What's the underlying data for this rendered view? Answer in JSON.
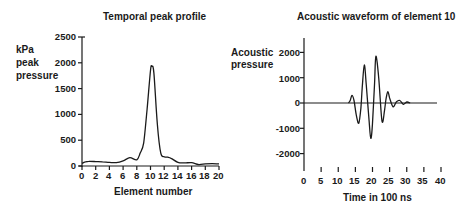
{
  "chart_data": [
    {
      "type": "line",
      "title": "Temporal peak profile",
      "xlabel": "Element number",
      "ylabel": "kPa peak pressure",
      "ylabel_lines": [
        "kPa",
        "peak",
        "pressure"
      ],
      "xlim": [
        0,
        20
      ],
      "ylim": [
        0,
        2500
      ],
      "xticks": [
        0,
        2,
        4,
        6,
        8,
        10,
        12,
        14,
        16,
        18,
        20
      ],
      "yticks": [
        0,
        500,
        1000,
        1500,
        2000,
        2500
      ],
      "grid": false,
      "x": [
        0,
        0.5,
        1,
        2,
        3,
        4,
        5,
        6,
        7,
        8,
        8.5,
        9,
        9.5,
        10,
        10.2,
        10.5,
        11,
        11.5,
        12,
        12.5,
        13,
        14,
        15,
        16,
        17,
        18,
        19,
        20
      ],
      "values": [
        50,
        80,
        90,
        85,
        80,
        70,
        65,
        100,
        160,
        120,
        250,
        450,
        1100,
        1850,
        1930,
        1800,
        800,
        250,
        180,
        170,
        150,
        70,
        60,
        65,
        30,
        40,
        45,
        40
      ]
    },
    {
      "type": "line",
      "title": "Acoustic waveform of element 10",
      "xlabel": "Time in 100 ns",
      "ylabel": "Acoustic pressure",
      "ylabel_lines": [
        "Acoustic",
        "pressure"
      ],
      "xlim": [
        0,
        40
      ],
      "ylim": [
        -2500,
        2500
      ],
      "xticks": [
        0,
        5,
        10,
        15,
        20,
        25,
        30,
        35,
        40
      ],
      "yticks": [
        2000,
        1000,
        0,
        -1000,
        -2000
      ],
      "grid": false,
      "x": [
        0,
        13,
        13.5,
        14,
        14.6,
        15.3,
        16,
        16.6,
        17,
        17.6,
        18.2,
        19,
        19.5,
        20,
        20.6,
        21,
        21.8,
        22.6,
        23,
        23.5,
        24,
        24.5,
        25,
        26,
        27,
        28,
        29,
        30,
        31,
        40
      ],
      "values": [
        0,
        0,
        100,
        300,
        100,
        -500,
        -800,
        -200,
        600,
        1500,
        700,
        -700,
        -1400,
        -800,
        800,
        1850,
        1000,
        -500,
        -750,
        -300,
        200,
        450,
        200,
        -150,
        50,
        100,
        -50,
        40,
        0,
        0
      ]
    }
  ],
  "left_chart": {
    "title": "Temporal peak profile",
    "ylabel": [
      "kPa",
      "peak",
      "pressure"
    ],
    "xlabel": "Element number",
    "yticks": [
      "2500",
      "2000",
      "1500",
      "1000",
      "500",
      "0"
    ],
    "xticks": [
      "0",
      "2",
      "4",
      "6",
      "8",
      "10",
      "12",
      "14",
      "16",
      "18",
      "20"
    ]
  },
  "right_chart": {
    "title": "Acoustic waveform of element 10",
    "ylabel": [
      "Acoustic",
      "pressure"
    ],
    "xlabel": "Time in 100 ns",
    "yticks": [
      "2000",
      "1000",
      "0",
      "-1000",
      "-2000"
    ],
    "xticks": [
      "0",
      "5",
      "10",
      "15",
      "20",
      "25",
      "30",
      "35",
      "40"
    ]
  }
}
